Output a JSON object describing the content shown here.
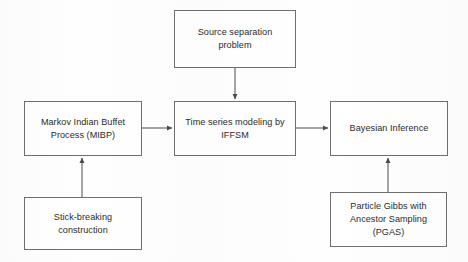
{
  "diagram": {
    "background_color": "#fefefe",
    "box_border_color": "#6f6f6f",
    "text_color": "#2b2b2b",
    "arrow_color": "#5a5a5a",
    "nodes": [
      {
        "id": "source-separation-problem",
        "label": "Source separation\nproblem",
        "x": 174,
        "y": 10,
        "w": 122,
        "h": 58
      },
      {
        "id": "markov-indian-buffet-process",
        "label": "Markov Indian Buffet\nProcess (MIBP)",
        "x": 24,
        "y": 101,
        "w": 118,
        "h": 55
      },
      {
        "id": "time-series-modeling-iffsm",
        "label": "Time series modeling by\nIFFSM",
        "x": 174,
        "y": 101,
        "w": 122,
        "h": 55
      },
      {
        "id": "bayesian-inference",
        "label": "Bayesian Inference",
        "x": 330,
        "y": 101,
        "w": 118,
        "h": 55
      },
      {
        "id": "stick-breaking-construction",
        "label": "Stick-breaking\nconstruction",
        "x": 24,
        "y": 197,
        "w": 118,
        "h": 53
      },
      {
        "id": "particle-gibbs-ancestor-sampling",
        "label": "Particle Gibbs with\nAncestor Sampling\n(PGAS)",
        "x": 330,
        "y": 192,
        "w": 117,
        "h": 55
      }
    ],
    "edges": [
      {
        "id": "edge-source-to-timeseries",
        "from": "source-separation-problem",
        "to": "time-series-modeling-iffsm",
        "direction": "down",
        "x1": 235,
        "y1": 68,
        "x2": 235,
        "y2": 99
      },
      {
        "id": "edge-mibp-to-timeseries",
        "from": "markov-indian-buffet-process",
        "to": "time-series-modeling-iffsm",
        "direction": "right",
        "x1": 142,
        "y1": 128,
        "x2": 172,
        "y2": 128
      },
      {
        "id": "edge-timeseries-to-bayesian",
        "from": "time-series-modeling-iffsm",
        "to": "bayesian-inference",
        "direction": "right",
        "x1": 296,
        "y1": 128,
        "x2": 328,
        "y2": 128
      },
      {
        "id": "edge-stickbreaking-to-mibp",
        "from": "stick-breaking-construction",
        "to": "markov-indian-buffet-process",
        "direction": "up",
        "x1": 82,
        "y1": 197,
        "x2": 82,
        "y2": 158
      },
      {
        "id": "edge-pgas-to-bayesian",
        "from": "particle-gibbs-ancestor-sampling",
        "to": "bayesian-inference",
        "direction": "up",
        "x1": 388,
        "y1": 192,
        "x2": 388,
        "y2": 158
      }
    ]
  }
}
